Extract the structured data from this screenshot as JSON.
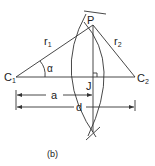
{
  "diagram": {
    "caption": "(b)",
    "points": {
      "P": {
        "label": "P"
      },
      "C1": {
        "label": "C",
        "sub": "1"
      },
      "C2": {
        "label": "C",
        "sub": "2"
      },
      "J": {
        "label": "J"
      }
    },
    "segments": {
      "r1": {
        "label": "r",
        "sub": "1"
      },
      "r2": {
        "label": "r",
        "sub": "2"
      }
    },
    "angle": {
      "label": "α"
    },
    "dimensions": {
      "a": {
        "label": "a"
      },
      "d": {
        "label": "d"
      }
    },
    "colors": {
      "line": "#333333",
      "text": "#222222",
      "background": "#ffffff"
    }
  }
}
